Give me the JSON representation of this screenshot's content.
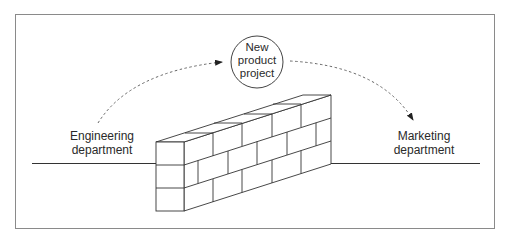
{
  "diagram": {
    "center_node": {
      "lines": [
        "New",
        "product",
        "project"
      ]
    },
    "left_node": {
      "lines": [
        "Engineering",
        "department"
      ]
    },
    "right_node": {
      "lines": [
        "Marketing",
        "department"
      ]
    },
    "barrier": "brick-wall-icon",
    "edges": [
      {
        "from": "Engineering department",
        "to": "New product project",
        "style": "dashed-arrow"
      },
      {
        "from": "New product project",
        "to": "Marketing department",
        "style": "dashed-arrow"
      }
    ],
    "colors": {
      "line": "#333333",
      "dashed": "#666666",
      "border": "#8a8a8a"
    }
  }
}
